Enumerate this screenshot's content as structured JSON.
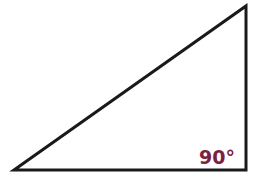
{
  "diagram": {
    "type": "right-triangle",
    "vertices": {
      "bottom_left": [
        14,
        170
      ],
      "top_right": [
        246,
        6
      ],
      "bottom_right": [
        246,
        170
      ]
    },
    "stroke_color": "#1a1a1a",
    "right_angle_label": "90°",
    "label_color": "#7a2040"
  }
}
